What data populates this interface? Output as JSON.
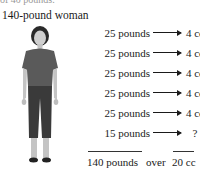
{
  "diagram": {
    "clipped_header_text": "of 40 pounds.",
    "title": "140-pound woman",
    "figure_label": "woman-standing-photo",
    "rows": [
      {
        "weight": "25 pounds",
        "dose": "4 cc"
      },
      {
        "weight": "25 pounds",
        "dose": "4 cc"
      },
      {
        "weight": "25 pounds",
        "dose": "4 cc"
      },
      {
        "weight": "25 pounds",
        "dose": "4 cc"
      },
      {
        "weight": "25 pounds",
        "dose": "4 cc"
      },
      {
        "weight": "15 pounds",
        "dose": "?"
      }
    ],
    "total": {
      "weight": "140 pounds",
      "connector": "over",
      "dose": "20 cc"
    },
    "colors": {
      "text": "#1a1a1a",
      "shirt": "#5a5a5a",
      "pants": "#3a3a3a",
      "skin": "#c8c8c8",
      "hair": "#2a2a2a"
    }
  }
}
